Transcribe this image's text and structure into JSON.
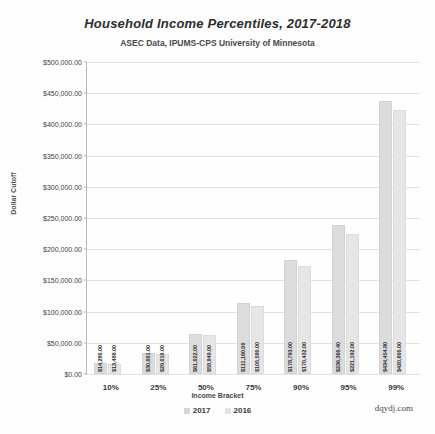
{
  "chart_data": {
    "type": "bar",
    "title": "Household Income Percentiles, 2017-2018",
    "subtitle": "ASEC Data, IPUMS-CPS University of Minnesota",
    "xlabel": "Income Bracket",
    "ylabel": "Dollar Cutoff",
    "ylim": [
      0,
      500000
    ],
    "grid": true,
    "legend_position": "bottom",
    "watermark": "dqydj.com",
    "categories": [
      "10%",
      "25%",
      "50%",
      "75%",
      "90%",
      "95%",
      "99%"
    ],
    "ytick_labels": [
      "$0.00",
      "$50,000.00",
      "$100,000.00",
      "$150,000.00",
      "$200,000.00",
      "$250,000.00",
      "$300,000.00",
      "$350,000.00",
      "$400,000.00",
      "$450,000.00",
      "$500,000.00"
    ],
    "ytick_values": [
      0,
      50000,
      100000,
      150000,
      200000,
      250000,
      300000,
      350000,
      400000,
      450000,
      500000
    ],
    "series": [
      {
        "name": "2017",
        "color": "#dcdcdc",
        "values": [
          14280.0,
          30001.0,
          61022.0,
          111160.0,
          178793.0,
          236360.4,
          434454.8
        ],
        "labels": [
          "$14,280.00",
          "$30,001.00",
          "$61,022.00",
          "$111,160.00",
          "$178,793.00",
          "$236,360.40",
          "$434,454.80"
        ]
      },
      {
        "name": "2016",
        "color": "#e6e6e6",
        "values": [
          13488.0,
          29010.0,
          58849.0,
          105580.0,
          170432.0,
          221192.0,
          420600.0
        ],
        "labels": [
          "$13,488.00",
          "$29,010.00",
          "$58,849.00",
          "$105,580.00",
          "$170,432.00",
          "$221,192.00",
          "$420,600.00"
        ]
      }
    ]
  }
}
